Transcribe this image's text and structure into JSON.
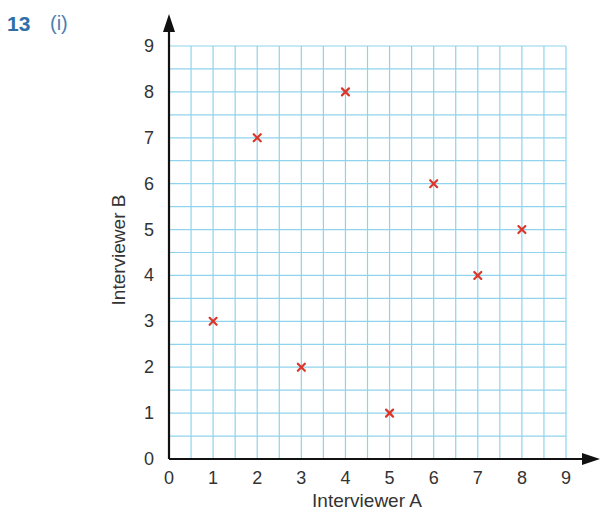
{
  "question": {
    "number": "13",
    "part": "(i)"
  },
  "chart_data": {
    "type": "scatter",
    "title": "",
    "xlabel": "Interviewer A",
    "ylabel": "Interviewer B",
    "xlim": [
      0,
      9
    ],
    "ylim": [
      0,
      9
    ],
    "x_ticks": [
      "0",
      "1",
      "2",
      "3",
      "4",
      "5",
      "6",
      "7",
      "8",
      "9"
    ],
    "y_ticks": [
      "0",
      "1",
      "2",
      "3",
      "4",
      "5",
      "6",
      "7",
      "8",
      "9"
    ],
    "grid": true,
    "grid_step": 0.5,
    "marker": "x",
    "series": [
      {
        "name": "Interviewer scores",
        "points": [
          {
            "x": 1,
            "y": 3
          },
          {
            "x": 2,
            "y": 7
          },
          {
            "x": 3,
            "y": 2
          },
          {
            "x": 4,
            "y": 8
          },
          {
            "x": 5,
            "y": 1
          },
          {
            "x": 6,
            "y": 6
          },
          {
            "x": 7,
            "y": 4
          },
          {
            "x": 8,
            "y": 5
          }
        ]
      }
    ],
    "colors": {
      "grid": "#8fd3ec",
      "axis": "#111111",
      "marker": "#d9372b",
      "tick_label": "#333333"
    }
  }
}
